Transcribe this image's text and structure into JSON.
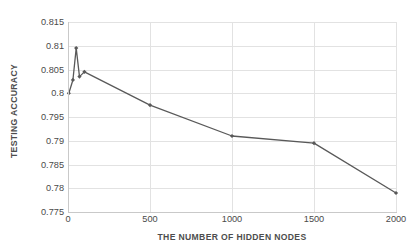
{
  "chart_data": {
    "type": "line",
    "title": "",
    "xlabel": "THE NUMBER OF HIDDEN NODES",
    "ylabel": "TESTING ACCURACY",
    "xlim": [
      0,
      2000
    ],
    "ylim": [
      0.775,
      0.815
    ],
    "xticks": [
      0,
      500,
      1000,
      1500,
      2000
    ],
    "xticklabels": [
      "0",
      "500",
      "1000",
      "1500",
      "2000"
    ],
    "yticks": [
      0.775,
      0.78,
      0.785,
      0.79,
      0.795,
      0.8,
      0.805,
      0.81,
      0.815
    ],
    "yticklabels": [
      "0.775",
      "0.78",
      "0.785",
      "0.79",
      "0.795",
      "0.8",
      "0.805",
      "0.81",
      "0.815"
    ],
    "grid": true,
    "legend": false,
    "series": [
      {
        "name": "testing accuracy",
        "color": "#595959",
        "marker": "diamond",
        "x": [
          5,
          30,
          50,
          70,
          100,
          500,
          1000,
          1500,
          2000
        ],
        "y": [
          0.8,
          0.8028,
          0.8095,
          0.8035,
          0.8045,
          0.7975,
          0.791,
          0.7895,
          0.779
        ]
      }
    ]
  },
  "style": {
    "line_color": "#595959",
    "grid_color": "#e2e2e2",
    "axis_color": "#c9c9c9",
    "text_color": "#4a4a4a",
    "background": "#ffffff"
  }
}
